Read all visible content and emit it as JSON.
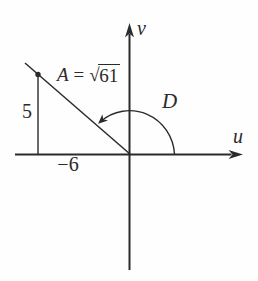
{
  "diagram": {
    "background": "#fefefe",
    "ink_color": "#2b2b2b",
    "axes": {
      "vertical_label": "v",
      "horizontal_label": "u"
    },
    "angle": {
      "label": "D"
    },
    "magnitude": {
      "lhs": "A",
      "equals": "=",
      "radical_sign": "√",
      "radicand": "61"
    },
    "components": {
      "vertical": "5",
      "horizontal": "−6"
    }
  }
}
